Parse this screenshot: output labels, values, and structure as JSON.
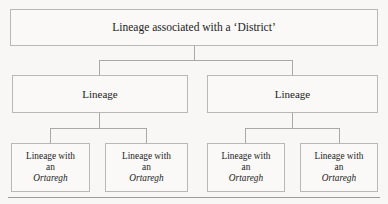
{
  "diagram": {
    "type": "hierarchy-tree",
    "levels": 3,
    "colors": {
      "background": "#f8f7f5",
      "box_fill": "#faf9f7",
      "box_border": "#b9b8b6",
      "connector": "#a9a8a6",
      "text": "#1c1c1c",
      "rule": "#9d9c9a"
    },
    "root": {
      "label": "Lineage associated with a ‘District’"
    },
    "branches": [
      {
        "label": "Lineage"
      },
      {
        "label": "Lineage"
      }
    ],
    "leaves": [
      {
        "line1": "Lineage with",
        "line2": "an",
        "term": "Ortaregh"
      },
      {
        "line1": "Lineage with",
        "line2": "an",
        "term": "Ortaregh"
      },
      {
        "line1": "Lineage with",
        "line2": "an",
        "term": "Ortaregh"
      },
      {
        "line1": "Lineage with",
        "line2": "an",
        "term": "Ortaregh"
      }
    ]
  }
}
